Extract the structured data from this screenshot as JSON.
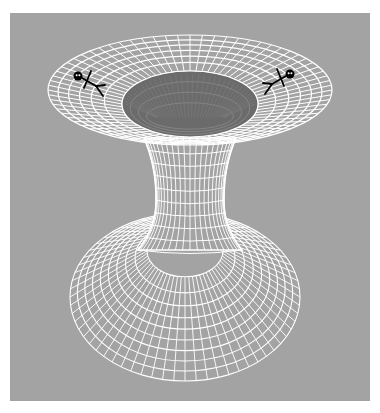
{
  "figure": {
    "background_color": "#a3a3a3",
    "grid_color": "#ffffff",
    "hole_color": "#6b6b6b",
    "figure_color": "#000000"
  },
  "upper_sheet": {
    "cx": 190,
    "cy": 90,
    "rx": 142,
    "ry": 55,
    "rings": 6,
    "spokes": 72
  },
  "hole": {
    "cx": 190,
    "cy": 104,
    "rx": 68,
    "ry": 33
  },
  "throat": {
    "top_y": 138,
    "waist_y": 200,
    "bottom_y": 250,
    "top_half_width": 46,
    "waist_half_width": 34,
    "bottom_half_width": 52,
    "cx": 190,
    "verticals": 22,
    "rings": 9
  },
  "lower_sheet": {
    "cx": 185,
    "cy": 297,
    "rx": 115,
    "ry": 84,
    "inner_rx": 38,
    "inner_ry": 26,
    "rings": 9,
    "spokes": 64
  },
  "people": [
    {
      "name": "left-person",
      "x": 78,
      "y": 76,
      "facing": "right"
    },
    {
      "name": "right-person",
      "x": 290,
      "y": 74,
      "facing": "left"
    }
  ]
}
